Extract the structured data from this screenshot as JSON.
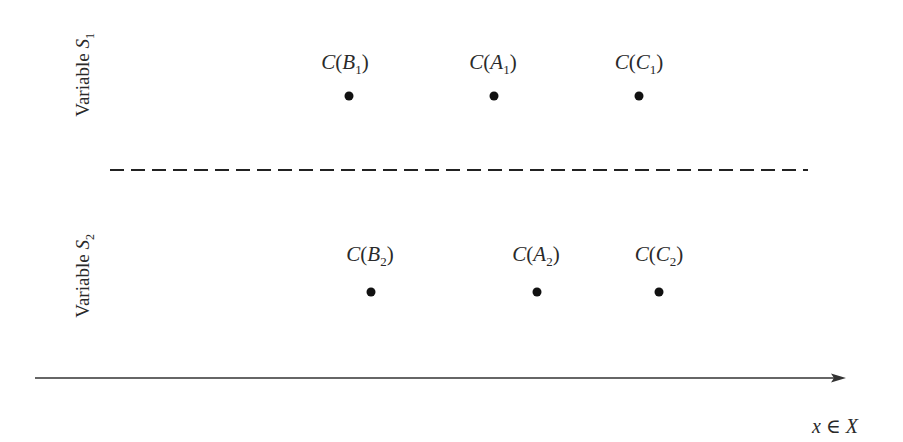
{
  "diagram": {
    "sections": [
      {
        "label_prefix": "Variable ",
        "label_var": "S",
        "label_sub": "1",
        "points": [
          {
            "fn": "C",
            "arg": "B",
            "sub": "1",
            "x": 349,
            "y": 96
          },
          {
            "fn": "C",
            "arg": "A",
            "sub": "1",
            "x": 494,
            "y": 96
          },
          {
            "fn": "C",
            "arg": "C",
            "sub": "1",
            "x": 639,
            "y": 96
          }
        ]
      },
      {
        "label_prefix": "Variable ",
        "label_var": "S",
        "label_sub": "2",
        "points": [
          {
            "fn": "C",
            "arg": "B",
            "sub": "2",
            "x": 371,
            "y": 292
          },
          {
            "fn": "C",
            "arg": "A",
            "sub": "2",
            "x": 537,
            "y": 292
          },
          {
            "fn": "C",
            "arg": "C",
            "sub": "2",
            "x": 659,
            "y": 292
          }
        ]
      }
    ],
    "separator": {
      "style": "dashed",
      "x1": 110,
      "x2": 808,
      "y": 170
    },
    "axis": {
      "x1": 35,
      "x2": 845,
      "y": 378,
      "label_var": "x",
      "label_op": " ∈ ",
      "label_set": "X"
    },
    "colors": {
      "ink": "#222222",
      "dot": "#111111",
      "background": "#ffffff"
    }
  }
}
